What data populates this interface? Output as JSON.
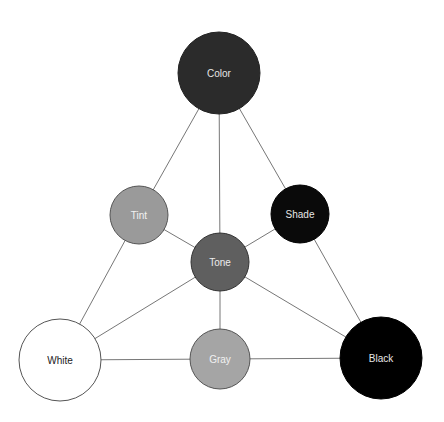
{
  "diagram": {
    "title": "",
    "nodes": [
      {
        "id": "color",
        "label": "Color",
        "cx": 219,
        "cy": 73,
        "r": 41,
        "fill": "#2b2b2b",
        "stroke": "#222222",
        "text": "#e6e6e6"
      },
      {
        "id": "tint",
        "label": "Tint",
        "cx": 139,
        "cy": 215,
        "r": 29,
        "fill": "#9a9a9a",
        "stroke": "#555555",
        "text": "#f2f2f2"
      },
      {
        "id": "shade",
        "label": "Shade",
        "cx": 300,
        "cy": 214,
        "r": 29,
        "fill": "#0a0a0a",
        "stroke": "#000000",
        "text": "#e6e6e6"
      },
      {
        "id": "tone",
        "label": "Tone",
        "cx": 220,
        "cy": 262,
        "r": 29,
        "fill": "#5f5f5f",
        "stroke": "#333333",
        "text": "#ececec"
      },
      {
        "id": "white",
        "label": "White",
        "cx": 60,
        "cy": 360,
        "r": 41,
        "fill": "#ffffff",
        "stroke": "#555555",
        "text": "#222222"
      },
      {
        "id": "gray",
        "label": "Gray",
        "cx": 220,
        "cy": 359,
        "r": 30,
        "fill": "#a5a5a5",
        "stroke": "#555555",
        "text": "#f2f2f2"
      },
      {
        "id": "black",
        "label": "Black",
        "cx": 381,
        "cy": 358,
        "r": 41,
        "fill": "#000000",
        "stroke": "#000000",
        "text": "#e6e6e6"
      }
    ],
    "edges": [
      [
        "color",
        "tint"
      ],
      [
        "color",
        "tone"
      ],
      [
        "color",
        "shade"
      ],
      [
        "tint",
        "white"
      ],
      [
        "tint",
        "tone"
      ],
      [
        "shade",
        "tone"
      ],
      [
        "shade",
        "black"
      ],
      [
        "tone",
        "white"
      ],
      [
        "tone",
        "gray"
      ],
      [
        "tone",
        "black"
      ],
      [
        "white",
        "gray"
      ],
      [
        "gray",
        "black"
      ]
    ],
    "edge_color": "#777777"
  }
}
